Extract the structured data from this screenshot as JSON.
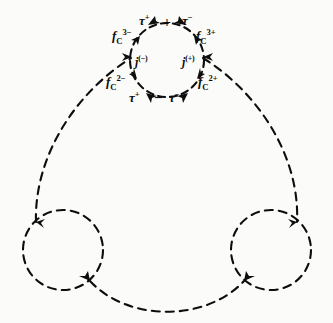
{
  "figure": {
    "kind": "feynman-like-dashed-loop-diagram",
    "background_color": "#fbfbfa",
    "ink_color": "#0d0d0d",
    "dash_pattern": "7 5",
    "stroke_width": 2.0,
    "canvas": {
      "width": 333,
      "height": 323
    }
  },
  "loops": {
    "top": {
      "cx": 167,
      "cy": 60,
      "r": 37
    },
    "bottom_left": {
      "cx": 63,
      "cy": 250,
      "r": 40
    },
    "bottom_right": {
      "cx": 271,
      "cy": 250,
      "r": 40
    }
  },
  "labels": {
    "tau_plus_top": {
      "base": "τ",
      "sup": "+",
      "x": 139,
      "y": 13
    },
    "plus_top": {
      "text": "+",
      "x": 163,
      "y": 16
    },
    "tau_minus_top": {
      "base": "τ",
      "sup": "−",
      "x": 182,
      "y": 13
    },
    "fc_3minus": {
      "base": "f",
      "sub": "C",
      "sup": "3−",
      "x": 112,
      "y": 28
    },
    "fc_3plus": {
      "base": "f",
      "sub": "C",
      "sup": "3+",
      "x": 196,
      "y": 28
    },
    "j_minus": {
      "base": "j",
      "sup": "(−)",
      "x": 135,
      "y": 55
    },
    "j_plus": {
      "base": "j",
      "sup": "(+)",
      "x": 182,
      "y": 55
    },
    "fc_2minus": {
      "base": "f",
      "sub": "C",
      "sup": "2−",
      "x": 106,
      "y": 74
    },
    "fc_2plus": {
      "base": "f",
      "sub": "C",
      "sup": "2+",
      "x": 198,
      "y": 74
    },
    "tau_plus_bot": {
      "base": "τ",
      "sup": "+",
      "x": 129,
      "y": 90
    },
    "minus_bot": {
      "text": "–",
      "x": 155,
      "y": 90
    },
    "tau_minus_bot": {
      "base": "τ",
      "sup": "−",
      "x": 169,
      "y": 90
    }
  },
  "vertices": [
    {
      "name": "top-circle-top-left",
      "x": 148,
      "y": 25
    },
    {
      "name": "top-circle-top-right",
      "x": 186,
      "y": 25
    },
    {
      "name": "top-circle-left",
      "x": 132,
      "y": 57
    },
    {
      "name": "top-circle-right",
      "x": 202,
      "y": 57
    },
    {
      "name": "top-circle-bottom-left",
      "x": 146,
      "y": 93
    },
    {
      "name": "top-circle-bottom-right",
      "x": 188,
      "y": 93
    },
    {
      "name": "bottom-left-circle-upper",
      "x": 36,
      "y": 222
    },
    {
      "name": "bottom-left-circle-lower",
      "x": 90,
      "y": 281
    },
    {
      "name": "bottom-right-circle-upper",
      "x": 297,
      "y": 222
    },
    {
      "name": "bottom-right-circle-lower",
      "x": 244,
      "y": 281
    }
  ]
}
